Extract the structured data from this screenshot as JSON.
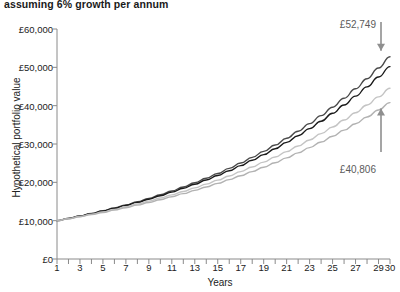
{
  "chart_data": {
    "type": "line",
    "title": "assuming 6% growth per annum",
    "xlabel": "Years",
    "ylabel": "Hypothetical portfolio value",
    "xlim": [
      1,
      30
    ],
    "ylim": [
      0,
      60000
    ],
    "grid": false,
    "legend": "none",
    "x": [
      1,
      2,
      3,
      4,
      5,
      6,
      7,
      8,
      9,
      10,
      11,
      12,
      13,
      14,
      15,
      16,
      17,
      18,
      19,
      20,
      21,
      22,
      23,
      24,
      25,
      26,
      27,
      28,
      29,
      30
    ],
    "x_tick_labels": [
      "1",
      "3",
      "5",
      "7",
      "9",
      "11",
      "13",
      "15",
      "17",
      "19",
      "21",
      "23",
      "25",
      "27",
      "29",
      "30"
    ],
    "y_tick_labels": [
      "£0",
      "£10,000",
      "£20,000",
      "£30,000",
      "£40,000",
      "£50,000",
      "£60,000"
    ],
    "y_tick_values": [
      0,
      10000,
      20000,
      30000,
      40000,
      50000,
      60000
    ],
    "series": [
      {
        "name": "gross-6pct",
        "color": "#4a4a4a",
        "start_value": 10000,
        "end_value": 52749,
        "values": [
          10000,
          10651,
          11345,
          12083,
          12870,
          13707,
          14599,
          15549,
          16561,
          17639,
          18787,
          20009,
          21312,
          22699,
          24177,
          25750,
          27427,
          29212,
          31114,
          33140,
          35297,
          37595,
          40042,
          42649,
          45425,
          48383,
          51534,
          54889,
          58464,
          52749
        ]
      },
      {
        "name": "net-charges-a",
        "color": "#1a1a1a",
        "start_value": 10000,
        "end_value": 50196,
        "values": [
          10000,
          10615,
          11268,
          11961,
          12697,
          13478,
          14308,
          15188,
          16122,
          17114,
          18167,
          19285,
          20472,
          21731,
          23068,
          24487,
          25993,
          27591,
          29288,
          31089,
          33001,
          35030,
          37185,
          39472,
          41900,
          44478,
          47215,
          50121,
          53206,
          50196
        ]
      },
      {
        "name": "net-charges-b",
        "color": "#c4c4c4",
        "start_value": 10000,
        "end_value": 44538,
        "values": [
          10000,
          10540,
          11109,
          11709,
          12341,
          13008,
          13711,
          14451,
          15232,
          16055,
          16922,
          17836,
          18799,
          19814,
          20884,
          22012,
          23201,
          24454,
          25775,
          27167,
          28635,
          30181,
          31812,
          33530,
          35341,
          37250,
          39262,
          41383,
          43618,
          44538
        ]
      },
      {
        "name": "net-charges-c",
        "color": "#b2b2b2",
        "start_value": 10000,
        "end_value": 40806,
        "values": [
          10000,
          10490,
          11004,
          11543,
          12109,
          12702,
          13325,
          13978,
          14663,
          15381,
          16135,
          16926,
          17755,
          18625,
          19538,
          20495,
          21499,
          22553,
          23658,
          24817,
          26033,
          27309,
          28647,
          30050,
          31523,
          33067,
          34687,
          36387,
          38170,
          40806
        ]
      }
    ],
    "annotations": [
      {
        "name": "top-value",
        "label": "£52,749",
        "direction": "down",
        "target_series": "gross-6pct"
      },
      {
        "name": "bottom-value",
        "label": "£40,806",
        "direction": "up",
        "target_series": "net-charges-c"
      }
    ]
  }
}
